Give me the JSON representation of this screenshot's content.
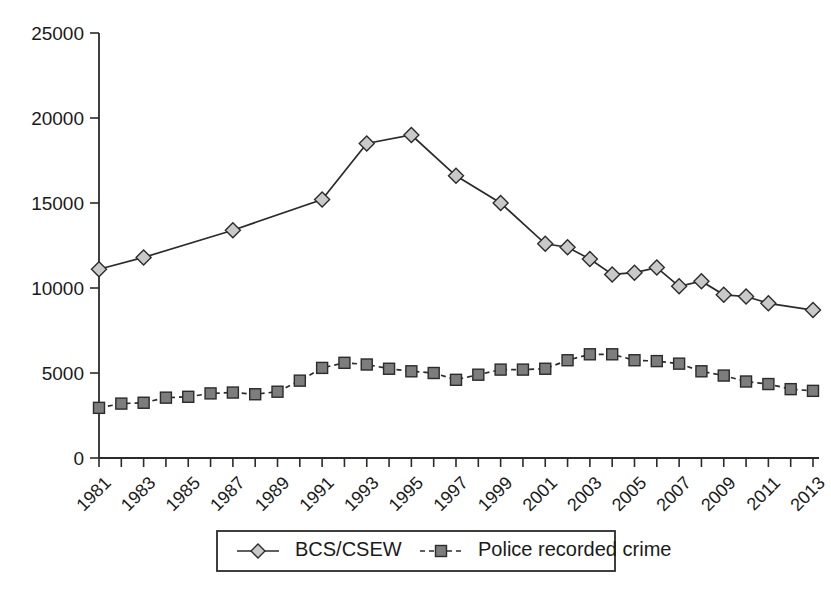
{
  "chart_data": {
    "type": "line",
    "title": "",
    "subtitle": "",
    "xlabel": "",
    "ylabel": "",
    "grid": false,
    "legend_position": "bottom",
    "x": [
      1981,
      1982,
      1983,
      1984,
      1985,
      1986,
      1987,
      1988,
      1989,
      1990,
      1991,
      1992,
      1993,
      1994,
      1995,
      1996,
      1997,
      1998,
      1999,
      2000,
      2001,
      2002,
      2003,
      2004,
      2005,
      2006,
      2007,
      2008,
      2009,
      2010,
      2011,
      2012,
      2013
    ],
    "xlim": [
      1981,
      2013
    ],
    "ylim": [
      0,
      25000
    ],
    "ytick_labels": [
      "0",
      "5000",
      "10000",
      "15000",
      "20000",
      "25000"
    ],
    "ytick_values": [
      0,
      5000,
      10000,
      15000,
      20000,
      25000
    ],
    "xtick_labels": [
      "1981",
      "1983",
      "1985",
      "1987",
      "1989",
      "1991",
      "1993",
      "1995",
      "1997",
      "1999",
      "2001",
      "2003",
      "2005",
      "2007",
      "2009",
      "2011",
      "2013"
    ],
    "xtick_values": [
      1981,
      1983,
      1985,
      1987,
      1989,
      1991,
      1993,
      1995,
      1997,
      1999,
      2001,
      2003,
      2005,
      2007,
      2009,
      2011,
      2013
    ],
    "series": [
      {
        "name": "BCS/CSEW",
        "marker": "diamond",
        "line_style": "solid",
        "points": [
          {
            "x": 1981,
            "y": 11100
          },
          {
            "x": 1983,
            "y": 11800
          },
          {
            "x": 1987,
            "y": 13400
          },
          {
            "x": 1991,
            "y": 15200
          },
          {
            "x": 1993,
            "y": 18500
          },
          {
            "x": 1995,
            "y": 19000
          },
          {
            "x": 1997,
            "y": 16600
          },
          {
            "x": 1999,
            "y": 15000
          },
          {
            "x": 2001,
            "y": 12600
          },
          {
            "x": 2002,
            "y": 12400
          },
          {
            "x": 2003,
            "y": 11700
          },
          {
            "x": 2004,
            "y": 10800
          },
          {
            "x": 2005,
            "y": 10900
          },
          {
            "x": 2006,
            "y": 11200
          },
          {
            "x": 2007,
            "y": 10100
          },
          {
            "x": 2008,
            "y": 10400
          },
          {
            "x": 2009,
            "y": 9600
          },
          {
            "x": 2010,
            "y": 9500
          },
          {
            "x": 2011,
            "y": 9100
          },
          {
            "x": 2013,
            "y": 8700
          }
        ]
      },
      {
        "name": "Police recorded crime",
        "marker": "square",
        "line_style": "dashed",
        "points": [
          {
            "x": 1981,
            "y": 2950
          },
          {
            "x": 1982,
            "y": 3200
          },
          {
            "x": 1983,
            "y": 3250
          },
          {
            "x": 1984,
            "y": 3550
          },
          {
            "x": 1985,
            "y": 3600
          },
          {
            "x": 1986,
            "y": 3800
          },
          {
            "x": 1987,
            "y": 3850
          },
          {
            "x": 1988,
            "y": 3750
          },
          {
            "x": 1989,
            "y": 3900
          },
          {
            "x": 1990,
            "y": 4550
          },
          {
            "x": 1991,
            "y": 5300
          },
          {
            "x": 1992,
            "y": 5600
          },
          {
            "x": 1993,
            "y": 5500
          },
          {
            "x": 1994,
            "y": 5250
          },
          {
            "x": 1995,
            "y": 5100
          },
          {
            "x": 1996,
            "y": 5000
          },
          {
            "x": 1997,
            "y": 4600
          },
          {
            "x": 1998,
            "y": 4900
          },
          {
            "x": 1999,
            "y": 5200
          },
          {
            "x": 2000,
            "y": 5200
          },
          {
            "x": 2001,
            "y": 5250
          },
          {
            "x": 2002,
            "y": 5750
          },
          {
            "x": 2003,
            "y": 6100
          },
          {
            "x": 2004,
            "y": 6100
          },
          {
            "x": 2005,
            "y": 5750
          },
          {
            "x": 2006,
            "y": 5700
          },
          {
            "x": 2007,
            "y": 5550
          },
          {
            "x": 2008,
            "y": 5100
          },
          {
            "x": 2009,
            "y": 4850
          },
          {
            "x": 2010,
            "y": 4500
          },
          {
            "x": 2011,
            "y": 4350
          },
          {
            "x": 2012,
            "y": 4050
          },
          {
            "x": 2013,
            "y": 3950
          }
        ]
      }
    ]
  },
  "legend": {
    "items": [
      {
        "label": "BCS/CSEW",
        "marker": "diamond-marker",
        "style": "solid"
      },
      {
        "label": "Police recorded crime",
        "marker": "square-marker",
        "style": "dashed"
      }
    ]
  },
  "colors": {
    "axis": "#2b2b2b",
    "line": "#2b2b2b",
    "diamond_fill": "#c9c9c9",
    "square_fill": "#7d7d7d",
    "background": "#ffffff"
  }
}
